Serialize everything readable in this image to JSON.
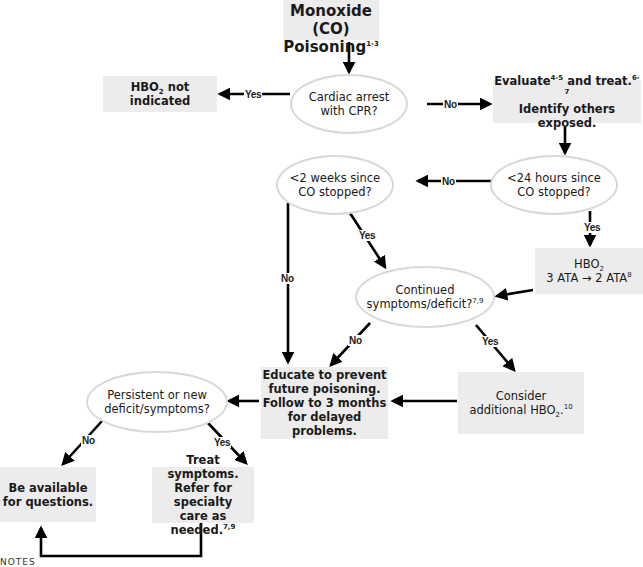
{
  "diagram": {
    "title": {
      "line1": "Carbon Monoxide",
      "line2": "(CO) Poisoning",
      "sup": "1-3"
    },
    "nodes": {
      "cardiac_arrest": {
        "type": "decision",
        "line1": "Cardiac arrest",
        "line2": "with CPR?"
      },
      "hbo_not_indicated": {
        "type": "action",
        "pre": "HBO",
        "sub": "2",
        "post": " not indicated"
      },
      "evaluate": {
        "type": "action",
        "line1_a": "Evaluate",
        "line1_sup1": "4-5",
        "line1_b": " and treat.",
        "line1_sup2": "6-7",
        "line2": "Identify others exposed."
      },
      "lt_24_hours": {
        "type": "decision",
        "line1": "<24 hours since",
        "line2": "CO stopped?"
      },
      "lt_2_weeks": {
        "type": "decision",
        "line1": "<2 weeks since",
        "line2": "CO stopped?"
      },
      "hbo_treatment": {
        "type": "action",
        "line1_pre": "HBO",
        "line1_sub": "2",
        "line2": "3 ATA → 2 ATA",
        "line2_sup": "8"
      },
      "continued_symptoms": {
        "type": "decision",
        "line1": "Continued",
        "line2": "symptoms/deficit?",
        "line2_sup": "7,9"
      },
      "educate": {
        "type": "action",
        "line1": "Educate to prevent",
        "line2": "future poisoning.",
        "line3": "Follow to 3 months",
        "line4": "for delayed problems."
      },
      "consider_hbo": {
        "type": "action",
        "line1": "Consider",
        "line2_pre": "additional HBO",
        "line2_sub": "2",
        "line2_post": ".",
        "line2_sup": "10"
      },
      "persistent_symptoms": {
        "type": "decision",
        "line1": "Persistent or new",
        "line2": "deficit/symptoms?"
      },
      "be_available": {
        "type": "action",
        "line1": "Be available",
        "line2": "for questions."
      },
      "treat_symptoms": {
        "type": "action",
        "line1": "Treat symptoms.",
        "line2": "Refer for specialty",
        "line3": "care as needed.",
        "line3_sup": "7,9"
      }
    },
    "edges": [
      {
        "from": "title",
        "to": "cardiac_arrest",
        "label": ""
      },
      {
        "from": "cardiac_arrest",
        "to": "hbo_not_indicated",
        "label": "Yes"
      },
      {
        "from": "cardiac_arrest",
        "to": "evaluate",
        "label": "No"
      },
      {
        "from": "evaluate",
        "to": "lt_24_hours",
        "label": ""
      },
      {
        "from": "lt_24_hours",
        "to": "lt_2_weeks",
        "label": "No"
      },
      {
        "from": "lt_24_hours",
        "to": "hbo_treatment",
        "label": "Yes"
      },
      {
        "from": "lt_2_weeks",
        "to": "continued_symptoms",
        "label": "Yes"
      },
      {
        "from": "lt_2_weeks",
        "to": "educate",
        "label": "No"
      },
      {
        "from": "hbo_treatment",
        "to": "continued_symptoms",
        "label": ""
      },
      {
        "from": "continued_symptoms",
        "to": "educate",
        "label": "No"
      },
      {
        "from": "continued_symptoms",
        "to": "consider_hbo",
        "label": "Yes"
      },
      {
        "from": "consider_hbo",
        "to": "educate",
        "label": ""
      },
      {
        "from": "educate",
        "to": "persistent_symptoms",
        "label": ""
      },
      {
        "from": "persistent_symptoms",
        "to": "be_available",
        "label": "No"
      },
      {
        "from": "persistent_symptoms",
        "to": "treat_symptoms",
        "label": "Yes"
      },
      {
        "from": "treat_symptoms",
        "to": "be_available",
        "label": ""
      }
    ],
    "labels": {
      "yes": "Yes",
      "no": "No"
    },
    "footer": {
      "notes": "NOTES"
    },
    "colors": {
      "box_fill": "#ececec",
      "ellipse_border": "#d8d8d8",
      "arrow": "#000000",
      "text": "#1a1a1a"
    }
  }
}
